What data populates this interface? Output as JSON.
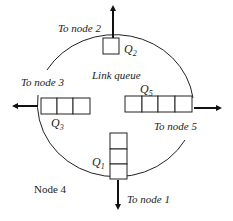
{
  "diagram": {
    "title": "Link queue",
    "node_label": "Node 4",
    "outputs": [
      {
        "id": "to-node-2",
        "label": "To node 2",
        "direction": "up"
      },
      {
        "id": "to-node-3",
        "label": "To node 3",
        "direction": "left"
      },
      {
        "id": "to-node-5",
        "label": "To node 5",
        "direction": "right"
      },
      {
        "id": "to-node-1",
        "label": "To node 1",
        "direction": "down"
      }
    ],
    "queues": [
      {
        "id": "Q2",
        "label": "Q",
        "sub": "2",
        "cells": 1,
        "orientation": "single"
      },
      {
        "id": "Q3",
        "label": "Q",
        "sub": "3",
        "cells": 3,
        "orientation": "horizontal"
      },
      {
        "id": "Q5",
        "label": "Q",
        "sub": "5",
        "cells": 4,
        "orientation": "horizontal"
      },
      {
        "id": "Q1",
        "label": "Q",
        "sub": "1",
        "cells": 3,
        "orientation": "vertical"
      }
    ]
  }
}
